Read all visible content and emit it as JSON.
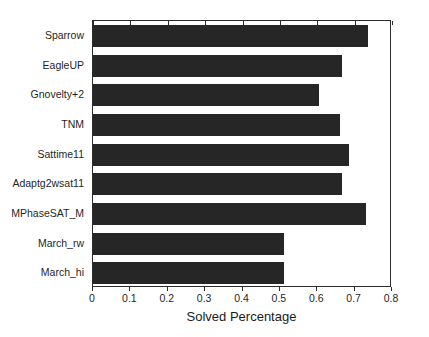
{
  "chart_data": {
    "type": "bar",
    "orientation": "horizontal",
    "title": "",
    "xlabel": "Solved Percentage",
    "ylabel": "",
    "xlim": [
      0,
      0.8
    ],
    "xticks": [
      "0",
      "0.1",
      "0.2",
      "0.3",
      "0.4",
      "0.5",
      "0.6",
      "0.7",
      "0.8"
    ],
    "xtick_values": [
      0,
      0.1,
      0.2,
      0.3,
      0.4,
      0.5,
      0.6,
      0.7,
      0.8
    ],
    "grid": false,
    "legend": null,
    "bar_color": "#262626",
    "categories": [
      "Sparrow",
      "EagleUP",
      "Gnovelty+2",
      "TNM",
      "Sattime11",
      "Adaptg2wsat11",
      "MPhaseSAT_M",
      "March_rw",
      "March_hi"
    ],
    "values": [
      0.735,
      0.665,
      0.605,
      0.66,
      0.685,
      0.665,
      0.73,
      0.51,
      0.51
    ]
  },
  "axis": {
    "x_title": "Solved Percentage"
  }
}
